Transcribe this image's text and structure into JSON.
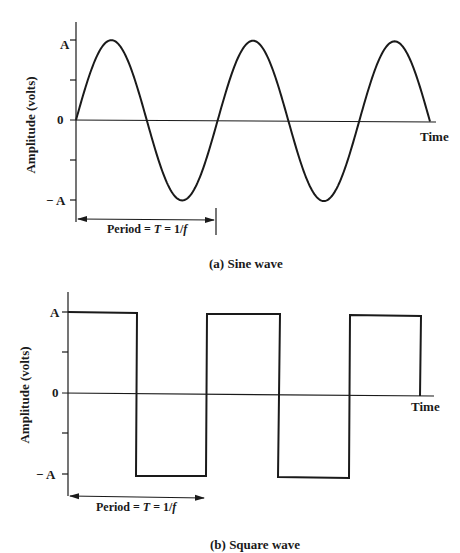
{
  "chart_data": [
    {
      "type": "line",
      "title": "(a) Sine wave",
      "xlabel": "Time",
      "ylabel": "Amplitude (volts)",
      "yticks": [
        "A",
        "0",
        "− A"
      ],
      "ylim": [
        "-A",
        "A"
      ],
      "series": [
        {
          "name": "sine",
          "function": "A*sin(2*pi*f*t)",
          "cycles": 2.5
        }
      ],
      "annotation": "Period = T = 1/f",
      "grid": false
    },
    {
      "type": "line",
      "title": "(b) Square wave",
      "xlabel": "Time",
      "ylabel": "Amplitude (volts)",
      "yticks": [
        "A",
        "0",
        "− A"
      ],
      "ylim": [
        "-A",
        "A"
      ],
      "series": [
        {
          "name": "square",
          "levels": [
            "A",
            "-A",
            "A",
            "-A",
            "A"
          ],
          "cycles": 2.5
        }
      ],
      "annotation": "Period = T = 1/f",
      "grid": false
    }
  ],
  "sine": {
    "caption": "(a) Sine wave",
    "ylabel": "Amplitude (volts)",
    "xlabel": "Time",
    "tick_A": "A",
    "tick_zero": "0",
    "tick_negA": "− A",
    "period_label_pre": "Period = ",
    "period_label_T": "T",
    "period_label_mid": " = 1/",
    "period_label_f": "f"
  },
  "square": {
    "caption": "(b) Square wave",
    "ylabel": "Amplitude (volts)",
    "xlabel": "Time",
    "tick_A": "A",
    "tick_zero": "0",
    "tick_negA": "− A",
    "period_label_pre": "Period = ",
    "period_label_T": "T",
    "period_label_mid": " = 1/",
    "period_label_f": "f"
  },
  "colors": {
    "ink": "#1a1a1a",
    "background": "#ffffff"
  }
}
